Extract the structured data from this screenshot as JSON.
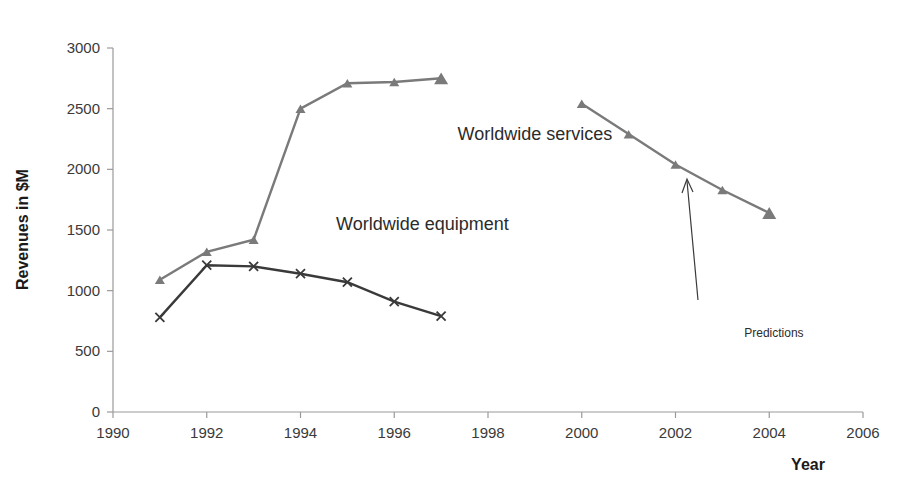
{
  "chart_data": {
    "type": "line",
    "title": "",
    "xlabel": "Year",
    "ylabel": "Revenues in $M",
    "xlim": [
      1990,
      2006
    ],
    "ylim": [
      0,
      3000
    ],
    "xticks": [
      1990,
      1992,
      1994,
      1996,
      1998,
      2000,
      2002,
      2004,
      2006
    ],
    "yticks": [
      0,
      500,
      1000,
      1500,
      2000,
      2500,
      3000
    ],
    "grid": false,
    "legend": "inline-annotations",
    "series": [
      {
        "name": "Worldwide services",
        "color": "#7a7a7a",
        "marker": "triangle",
        "x": [
          1991,
          1992,
          1993,
          1994,
          1995,
          1996,
          1997
        ],
        "values": [
          1090,
          1320,
          1420,
          2500,
          2710,
          2720,
          2750
        ]
      },
      {
        "name": "Worldwide equipment",
        "color": "#3a3a3a",
        "marker": "x",
        "x": [
          1991,
          1992,
          1993,
          1994,
          1995,
          1996,
          1997
        ],
        "values": [
          780,
          1210,
          1200,
          1140,
          1070,
          910,
          790
        ]
      },
      {
        "name": "Predictions",
        "color": "#7a7a7a",
        "marker": "triangle",
        "x": [
          2000,
          2001,
          2002,
          2003,
          2004
        ],
        "values": [
          2540,
          2290,
          2040,
          1830,
          1640
        ]
      }
    ],
    "annotations": [
      {
        "text": "Worldwide services",
        "x": 1999.0,
        "y": 2240
      },
      {
        "text": "Worldwide equipment",
        "x": 1996.6,
        "y": 1500
      },
      {
        "text": "Predictions",
        "x": 2004.1,
        "y": 620
      }
    ]
  },
  "axis": {
    "y_title": "Revenues in $M",
    "x_title": "Year",
    "y_tick_labels": [
      "3000",
      "2500",
      "2000",
      "1500",
      "1000",
      "500",
      "0"
    ],
    "x_tick_labels": [
      "1990",
      "1992",
      "1994",
      "1996",
      "1998",
      "2000",
      "2002",
      "2004",
      "2006"
    ]
  },
  "labels": {
    "services": "Worldwide services",
    "equipment": "Worldwide equipment",
    "predictions": "Predictions"
  },
  "colors": {
    "services_line": "#7a7a7a",
    "equipment_line": "#3a3a3a",
    "axis": "#9a9a9a",
    "text": "#2b2b2b",
    "background": "#ffffff"
  }
}
